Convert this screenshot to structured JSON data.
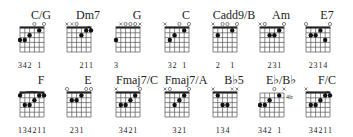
{
  "chord_chart": {
    "chords": [
      {
        "name": "C/G",
        "x": 20,
        "y": 9,
        "strings": [
          "3",
          "3",
          "2",
          "0",
          "1",
          "0"
        ],
        "markers": [
          "",
          "",
          "",
          "o",
          "",
          "o"
        ],
        "fingers": [
          "3",
          "4",
          "2",
          "",
          "1",
          ""
        ],
        "barre": null,
        "fret_label": ""
      },
      {
        "name": "Dm7",
        "x": 67,
        "y": 9,
        "strings": [
          "x",
          "x",
          "0",
          "2",
          "1",
          "1"
        ],
        "markers": [
          "x",
          "x",
          "o",
          "",
          "",
          ""
        ],
        "fingers": [
          "",
          "",
          "",
          "2",
          "1",
          "1"
        ],
        "barre": {
          "from": 4,
          "to": 5,
          "fret": 1
        },
        "fret_label": ""
      },
      {
        "name": "G",
        "x": 116,
        "y": 9,
        "strings": [
          "3",
          "x",
          "0",
          "0",
          "0",
          "x"
        ],
        "markers": [
          "",
          "x",
          "o",
          "o",
          "o",
          "x"
        ],
        "fingers": [
          "3",
          "",
          "",
          "",
          "",
          ""
        ],
        "barre": null,
        "fret_label": ""
      },
      {
        "name": "C",
        "x": 165,
        "y": 9,
        "strings": [
          "x",
          "3",
          "2",
          "0",
          "1",
          "0"
        ],
        "markers": [
          "x",
          "",
          "",
          "o",
          "",
          "o"
        ],
        "fingers": [
          "",
          "3",
          "2",
          "",
          "1",
          ""
        ],
        "barre": null,
        "fret_label": ""
      },
      {
        "name": "Cadd9/B",
        "x": 213,
        "y": 9,
        "strings": [
          "x",
          "2",
          "0",
          "0",
          "1",
          "0"
        ],
        "markers": [
          "x",
          "",
          "o",
          "o",
          "",
          "o"
        ],
        "fingers": [
          "",
          "2",
          "",
          "",
          "1",
          ""
        ],
        "barre": null,
        "fret_label": ""
      },
      {
        "name": "Am",
        "x": 260,
        "y": 9,
        "strings": [
          "x",
          "0",
          "2",
          "2",
          "1",
          "0"
        ],
        "markers": [
          "x",
          "o",
          "",
          "",
          "",
          "o"
        ],
        "fingers": [
          "",
          "",
          "2",
          "3",
          "1",
          ""
        ],
        "barre": null,
        "fret_label": ""
      },
      {
        "name": "E7",
        "x": 306,
        "y": 9,
        "strings": [
          "0",
          "2",
          "2",
          "1",
          "3",
          "0"
        ],
        "markers": [
          "o",
          "",
          "",
          "",
          "",
          "o"
        ],
        "fingers": [
          "",
          "2",
          "3",
          "1",
          "4",
          ""
        ],
        "barre": null,
        "fret_label": ""
      },
      {
        "name": "F",
        "x": 20,
        "y": 74,
        "strings": [
          "1",
          "3",
          "3",
          "2",
          "1",
          "1"
        ],
        "markers": [
          "",
          "",
          "",
          "",
          "",
          ""
        ],
        "fingers": [
          "1",
          "3",
          "4",
          "2",
          "1",
          "1"
        ],
        "barre": {
          "from": 0,
          "to": 5,
          "fret": 1
        },
        "fret_label": ""
      },
      {
        "name": "E",
        "x": 67,
        "y": 74,
        "strings": [
          "0",
          "2",
          "2",
          "1",
          "0",
          "0"
        ],
        "markers": [
          "o",
          "",
          "",
          "",
          "o",
          "o"
        ],
        "fingers": [
          "",
          "2",
          "3",
          "1",
          "",
          ""
        ],
        "barre": null,
        "fret_label": ""
      },
      {
        "name": "Fmaj7/C",
        "x": 116,
        "y": 74,
        "strings": [
          "x",
          "3",
          "3",
          "2",
          "1",
          "0"
        ],
        "markers": [
          "x",
          "",
          "",
          "",
          "",
          "o"
        ],
        "fingers": [
          "",
          "3",
          "4",
          "2",
          "1",
          ""
        ],
        "barre": null,
        "fret_label": ""
      },
      {
        "name": "Fmaj7/A",
        "x": 165,
        "y": 74,
        "strings": [
          "x",
          "0",
          "3",
          "2",
          "1",
          "0"
        ],
        "markers": [
          "x",
          "o",
          "",
          "",
          "",
          "o"
        ],
        "fingers": [
          "",
          "",
          "3",
          "2",
          "1",
          ""
        ],
        "barre": null,
        "fret_label": ""
      },
      {
        "name": "B♭5",
        "x": 213,
        "y": 74,
        "strings": [
          "x",
          "1",
          "3",
          "3",
          "x",
          "x"
        ],
        "markers": [
          "x",
          "",
          "",
          "",
          "x",
          "x"
        ],
        "fingers": [
          "",
          "1",
          "3",
          "4",
          "",
          ""
        ],
        "barre": null,
        "fret_label": ""
      },
      {
        "name": "E♭/B♭",
        "x": 260,
        "y": 74,
        "strings": [
          "3",
          "3",
          "2",
          "0",
          "1",
          "x"
        ],
        "markers": [
          "",
          "",
          "",
          "o",
          "",
          "x"
        ],
        "fingers": [
          "3",
          "4",
          "2",
          "",
          "1",
          ""
        ],
        "barre": null,
        "fret_label": "4fr"
      },
      {
        "name": "F/C",
        "x": 306,
        "y": 74,
        "strings": [
          "x",
          "3",
          "3",
          "2",
          "1",
          "1"
        ],
        "markers": [
          "x",
          "",
          "",
          "",
          "",
          ""
        ],
        "fingers": [
          "",
          "3",
          "4",
          "2",
          "1",
          "1"
        ],
        "barre": {
          "from": 4,
          "to": 5,
          "fret": 1
        },
        "fret_label": ""
      }
    ]
  }
}
